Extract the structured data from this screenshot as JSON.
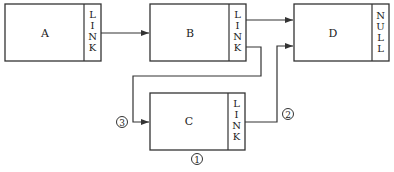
{
  "diagram": {
    "type": "linked-list-insertion",
    "nodes": [
      {
        "id": "A",
        "label": "A",
        "pointer_field": "LINK",
        "pointer_chars": [
          "L",
          "I",
          "N",
          "K"
        ]
      },
      {
        "id": "B",
        "label": "B",
        "pointer_field": "LINK",
        "pointer_chars": [
          "L",
          "I",
          "N",
          "K"
        ]
      },
      {
        "id": "C",
        "label": "C",
        "pointer_field": "LINK",
        "pointer_chars": [
          "L",
          "I",
          "N",
          "K"
        ]
      },
      {
        "id": "D",
        "label": "D",
        "pointer_field": "NULL",
        "pointer_chars": [
          "N",
          "U",
          "L",
          "L"
        ]
      }
    ],
    "edges": [
      {
        "from": "A",
        "to": "B"
      },
      {
        "from": "B",
        "to": "D"
      },
      {
        "from": "B",
        "to": "C",
        "step": "3"
      },
      {
        "from": "C",
        "to": "D",
        "step": "2"
      }
    ],
    "step_markers": {
      "one": "1",
      "two": "2",
      "three": "3"
    }
  }
}
